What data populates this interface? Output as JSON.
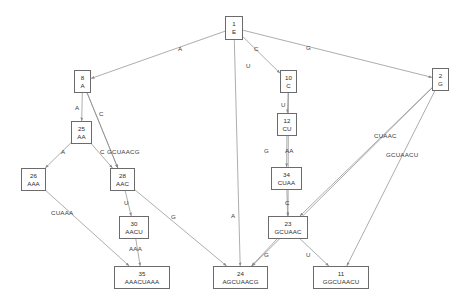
{
  "diagram": {
    "type": "suffix-tree",
    "width": 465,
    "height": 308,
    "background": "#ffffff",
    "node_border_color": "#6b6b6b",
    "edge_color": "#8a8a8a",
    "text_color": "#2b2b2b",
    "nodes": [
      {
        "id": "1",
        "label": "E",
        "x": 225,
        "y": 16,
        "w": 18,
        "h": 24
      },
      {
        "id": "8",
        "label": "A",
        "x": 74,
        "y": 70,
        "w": 17,
        "h": 23
      },
      {
        "id": "10",
        "label": "C",
        "x": 280,
        "y": 70,
        "w": 17,
        "h": 23
      },
      {
        "id": "2",
        "label": "G",
        "x": 432,
        "y": 68,
        "w": 17,
        "h": 23
      },
      {
        "id": "25",
        "label": "AA",
        "x": 71,
        "y": 121,
        "w": 21,
        "h": 23
      },
      {
        "id": "12",
        "label": "CU",
        "x": 277,
        "y": 113,
        "w": 20,
        "h": 23
      },
      {
        "id": "26",
        "label": "AAA",
        "x": 21,
        "y": 168,
        "w": 25,
        "h": 23
      },
      {
        "id": "28",
        "label": "AAC",
        "x": 110,
        "y": 168,
        "w": 25,
        "h": 23
      },
      {
        "id": "34",
        "label": "CUAA",
        "x": 271,
        "y": 167,
        "w": 31,
        "h": 23
      },
      {
        "id": "30",
        "label": "AACU",
        "x": 119,
        "y": 216,
        "w": 30,
        "h": 23
      },
      {
        "id": "23",
        "label": "GCUAAC",
        "x": 268,
        "y": 216,
        "w": 40,
        "h": 23
      },
      {
        "id": "35",
        "label": "AAACUAAA",
        "x": 114,
        "y": 266,
        "w": 56,
        "h": 23
      },
      {
        "id": "24",
        "label": "AGCUAACG",
        "x": 213,
        "y": 266,
        "w": 55,
        "h": 23
      },
      {
        "id": "11",
        "label": "GGCUAACU",
        "x": 313,
        "y": 266,
        "w": 56,
        "h": 23
      }
    ],
    "edges": [
      {
        "from": "1",
        "to": "8",
        "label": "A",
        "lx": 178,
        "ly": 45
      },
      {
        "from": "1",
        "to": "10",
        "label": "C",
        "lx": 254,
        "ly": 45
      },
      {
        "from": "1",
        "to": "24",
        "label": "U",
        "lx": 246,
        "ly": 62
      },
      {
        "from": "1",
        "to": "2",
        "label": "G",
        "lx": 306,
        "ly": 44
      },
      {
        "from": "8",
        "to": "25",
        "label": "A",
        "lx": 75,
        "ly": 104
      },
      {
        "from": "8",
        "to": "28",
        "label": "C",
        "lx": 99,
        "ly": 110
      },
      {
        "from": "25",
        "to": "26",
        "label": "A",
        "lx": 61,
        "ly": 148
      },
      {
        "from": "25",
        "to": "28",
        "label": "C",
        "lx": 100,
        "ly": 148
      },
      {
        "from": "8",
        "to": "28",
        "label": "GCUAACG",
        "lx": 107,
        "ly": 148
      },
      {
        "from": "28",
        "to": "30",
        "label": "U",
        "lx": 124,
        "ly": 199
      },
      {
        "from": "26",
        "to": "35",
        "label": "CUAAA",
        "lx": 51,
        "ly": 209
      },
      {
        "from": "30",
        "to": "35",
        "label": "AAA",
        "lx": 129,
        "ly": 245
      },
      {
        "from": "28",
        "to": "24",
        "label": "G",
        "lx": 171,
        "ly": 213
      },
      {
        "from": "10",
        "to": "12",
        "label": "U",
        "lx": 281,
        "ly": 101
      },
      {
        "from": "12",
        "to": "34",
        "label": "AA",
        "lx": 285,
        "ly": 147
      },
      {
        "from": "34",
        "to": "23",
        "label": "C",
        "lx": 285,
        "ly": 199
      },
      {
        "from": "10",
        "to": "23",
        "label": "G",
        "lx": 264,
        "ly": 147
      },
      {
        "from": "23",
        "to": "24",
        "label": "G",
        "lx": 264,
        "ly": 251
      },
      {
        "from": "23",
        "to": "11",
        "label": "U",
        "lx": 306,
        "ly": 251
      },
      {
        "from": "2",
        "to": "24",
        "label": "CUAAC",
        "lx": 374,
        "ly": 132
      },
      {
        "from": "2",
        "to": "11",
        "label": "GCUAACU",
        "lx": 386,
        "ly": 151
      },
      {
        "from": "2",
        "to": "23",
        "label": "A",
        "lx": 231,
        "ly": 212
      }
    ]
  }
}
